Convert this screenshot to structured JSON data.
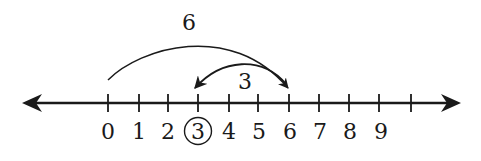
{
  "diagram": {
    "type": "number-line",
    "tick_labels": [
      "0",
      "1",
      "2",
      "3",
      "4",
      "5",
      "6",
      "7",
      "8",
      "9"
    ],
    "unlabeled_extra_ticks": 1,
    "circled_value": "3",
    "jumps": [
      {
        "label": "6",
        "from": 0,
        "to": 6,
        "direction": "right"
      },
      {
        "label": "3",
        "from": 6,
        "to": 3,
        "direction": "left"
      }
    ],
    "arrows_both_ends": true,
    "colors": {
      "ink": "#1a1a1a",
      "background": "#ffffff"
    }
  },
  "labels": {
    "t0": "0",
    "t1": "1",
    "t2": "2",
    "t3": "3",
    "t4": "4",
    "t5": "5",
    "t6": "6",
    "t7": "7",
    "t8": "8",
    "t9": "9",
    "jump_big": "6",
    "jump_small": "3"
  }
}
